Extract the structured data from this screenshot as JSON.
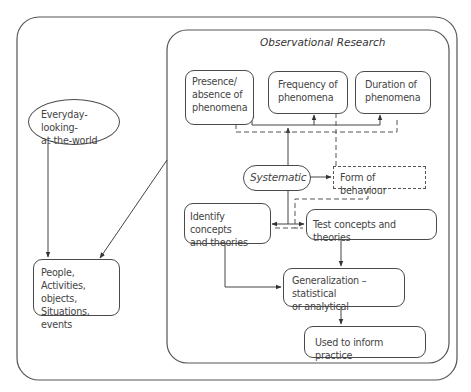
{
  "diagram": {
    "title": "Observational Research",
    "nodes": {
      "everyday": "Everyday-looking-at-the-world",
      "everyday_line1": "Everyday-looking-",
      "everyday_line2": "at-the-world",
      "people_line1": "People,",
      "people_line2": "Activities, objects,",
      "people_line3": "Situations, events",
      "presence_line1": "Presence/",
      "presence_line2": "absence of",
      "presence_line3": "phenomena",
      "frequency_line1": "Frequency of",
      "frequency_line2": "phenomena",
      "duration_line1": "Duration of",
      "duration_line2": "phenomena",
      "systematic": "Systematic",
      "form": "Form of behaviour",
      "identify_line1": "Identify concepts",
      "identify_line2": "and theories",
      "test": "Test concepts and theories",
      "generalization_line1": "Generalization – statistical",
      "generalization_line2": "or analytical",
      "used": "Used to inform practice"
    },
    "edges": [
      {
        "from": "everyday",
        "to": "people",
        "style": "solid"
      },
      {
        "from": "observational-research",
        "to": "people",
        "style": "solid"
      },
      {
        "from": "systematic",
        "to": "presence",
        "style": "solid"
      },
      {
        "from": "systematic",
        "to": "frequency",
        "style": "solid"
      },
      {
        "from": "systematic",
        "to": "duration",
        "style": "solid"
      },
      {
        "from": "systematic",
        "to": "form",
        "style": "solid"
      },
      {
        "from": "systematic",
        "to": "identify",
        "style": "solid"
      },
      {
        "from": "systematic",
        "to": "test",
        "style": "solid"
      },
      {
        "from": "form",
        "to": "identify",
        "style": "dashed"
      },
      {
        "from": "form",
        "to": "test",
        "style": "dashed"
      },
      {
        "from": "presence",
        "to": "form",
        "style": "dashed"
      },
      {
        "from": "frequency",
        "to": "form",
        "style": "dashed"
      },
      {
        "from": "duration",
        "to": "form",
        "style": "dashed"
      },
      {
        "from": "identify",
        "to": "generalization",
        "style": "solid"
      },
      {
        "from": "test",
        "to": "generalization",
        "style": "solid"
      },
      {
        "from": "generalization",
        "to": "used",
        "style": "solid"
      }
    ]
  }
}
